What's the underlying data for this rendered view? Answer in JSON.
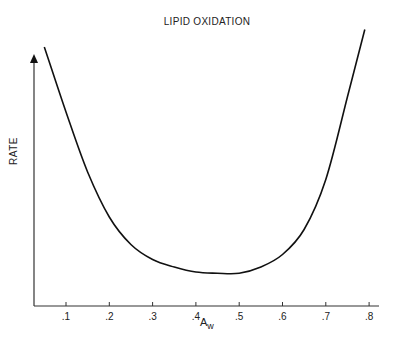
{
  "chart_data": {
    "type": "line",
    "title": "LIPID OXIDATION",
    "xlabel": "Aw",
    "ylabel": "RATE",
    "x_ticks": [
      ".1",
      ".2",
      ".3",
      ".4",
      ".5",
      ".6",
      ".7",
      ".8"
    ],
    "xlim": [
      0.03,
      0.82
    ],
    "ylim": [
      0,
      1
    ],
    "grid": false,
    "legend": null,
    "series": [
      {
        "name": "Lipid oxidation rate",
        "x": [
          0.05,
          0.1,
          0.15,
          0.2,
          0.25,
          0.3,
          0.35,
          0.4,
          0.45,
          0.5,
          0.55,
          0.6,
          0.65,
          0.7,
          0.75,
          0.79
        ],
        "values": [
          0.98,
          0.72,
          0.48,
          0.3,
          0.19,
          0.13,
          0.1,
          0.08,
          0.075,
          0.075,
          0.1,
          0.15,
          0.25,
          0.45,
          0.78,
          1.05
        ]
      }
    ]
  },
  "labels": {
    "title": "LIPID OXIDATION",
    "ylabel": "RATE",
    "xlabel_main": "A",
    "xlabel_sub": "w"
  }
}
